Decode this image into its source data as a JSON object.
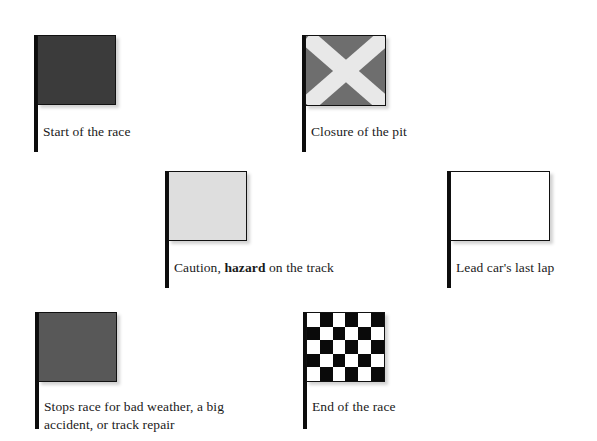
{
  "diagram": {
    "type": "racing-flag-legend",
    "background_color": "#ffffff",
    "flags": [
      {
        "id": "green",
        "icon": "solid-flag-icon",
        "caption": "Start of the race",
        "caption_bold_part": "",
        "banner_color": "#3b3b3b",
        "pole_color": "#0d0d0d",
        "pattern": "solid"
      },
      {
        "id": "x-saltire",
        "icon": "saltire-flag-icon",
        "caption": "Closure of the pit",
        "caption_bold_part": "",
        "banner_color": "#6e6e6e",
        "cross_color": "#e8e8e8",
        "pole_color": "#0d0d0d",
        "pattern": "saltire-cross"
      },
      {
        "id": "yellow",
        "icon": "solid-flag-icon",
        "caption_pre": "Caution, ",
        "caption_bold": "hazard",
        "caption_post": " on the track",
        "banner_color": "#dedede",
        "pole_color": "#0d0d0d",
        "pattern": "solid"
      },
      {
        "id": "white",
        "icon": "solid-flag-icon",
        "caption": "Lead car's last lap",
        "caption_bold_part": "",
        "banner_color": "#ffffff",
        "pole_color": "#0d0d0d",
        "pattern": "solid"
      },
      {
        "id": "red",
        "icon": "solid-flag-icon",
        "caption_line1": "Stops race for bad weather, a big",
        "caption_line2": "accident, or track repair",
        "banner_color": "#585858",
        "pole_color": "#0d0d0d",
        "pattern": "solid"
      },
      {
        "id": "checkered",
        "icon": "checkered-flag-icon",
        "caption": "End of the race",
        "caption_bold_part": "",
        "banner_color": "#ffffff",
        "checker_dark": "#0a0a0a",
        "checker_light": "#ffffff",
        "checker_columns": 6,
        "checker_rows": 5,
        "pole_color": "#0d0d0d",
        "pattern": "checkerboard"
      }
    ]
  }
}
